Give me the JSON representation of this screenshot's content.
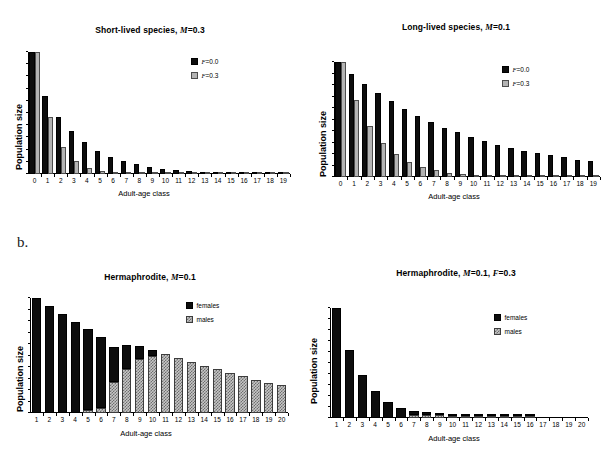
{
  "figure": {
    "panel_b_letter": "b."
  },
  "charts": [
    {
      "id": "short-lived",
      "title_main": "Short-lived species,",
      "title_param": "M",
      "title_value": "=0.3",
      "ylabel": "Population size",
      "xlabel": "Adult-age class",
      "legend": [
        {
          "label_ital": "F",
          "label_rest": "=0.0",
          "swatch": "black"
        },
        {
          "label_ital": "F",
          "label_rest": "=0.3",
          "swatch": "gray"
        }
      ],
      "chart_data": {
        "type": "bar",
        "title": "Short-lived species, M=0.3",
        "xlabel": "Adult-age class",
        "ylabel": "Population size",
        "grid": false,
        "legend_position": "upper-right-inside",
        "ylim": [
          0,
          100
        ],
        "categories": [
          "0",
          "1",
          "2",
          "3",
          "4",
          "5",
          "6",
          "7",
          "8",
          "9",
          "10",
          "11",
          "12",
          "13",
          "14",
          "15",
          "16",
          "17",
          "18",
          "19"
        ],
        "series": [
          {
            "name": "F=0.0",
            "color": "#0d0d0d",
            "values": [
              100,
              64,
              47,
              35,
              26,
              19,
              14,
              10.5,
              7.8,
              5.8,
              4.3,
              3.2,
              2.4,
              1.7,
              1.3,
              1.0,
              0.8,
              0.6,
              0.5,
              0.4
            ]
          },
          {
            "name": "F=0.3",
            "color": "#b4b4b4",
            "values": [
              100,
              47,
              22,
              10.5,
              5.0,
              2.3,
              1.1,
              0.5,
              0.3,
              0.2,
              0.15,
              0.1,
              0.1,
              0.1,
              0.1,
              0.1,
              0.1,
              0.1,
              0.1,
              0.1
            ]
          }
        ]
      }
    },
    {
      "id": "long-lived",
      "title_main": "Long-lived species,",
      "title_param": "M",
      "title_value": "=0.1",
      "ylabel": "Population size",
      "xlabel": "Adult-age class",
      "legend": [
        {
          "label_ital": "F",
          "label_rest": "=0.0",
          "swatch": "black"
        },
        {
          "label_ital": "F",
          "label_rest": "=0.3",
          "swatch": "gray"
        }
      ],
      "chart_data": {
        "type": "bar",
        "title": "Long-lived species, M=0.1",
        "xlabel": "Adult-age class",
        "ylabel": "Population size",
        "grid": false,
        "legend_position": "upper-right-inside",
        "ylim": [
          0,
          100
        ],
        "categories": [
          "0",
          "1",
          "2",
          "3",
          "4",
          "5",
          "6",
          "7",
          "8",
          "9",
          "10",
          "11",
          "12",
          "13",
          "14",
          "15",
          "16",
          "17",
          "18",
          "19"
        ],
        "series": [
          {
            "name": "F=0.0",
            "color": "#0d0d0d",
            "values": [
              100,
              90,
              81,
              73,
              66,
              59,
              53,
              48,
              43,
              39,
              35,
              31,
              28,
              25,
              23,
              21,
              19,
              17,
              15,
              14
            ]
          },
          {
            "name": "F=0.3",
            "color": "#b4b4b4",
            "values": [
              100,
              67,
              44,
              30,
              20,
              13,
              8.7,
              5.8,
              3.9,
              2.6,
              1.7,
              1.1,
              0.8,
              0.5,
              0.3,
              0.2,
              0.15,
              0.1,
              0.1,
              0.1
            ]
          }
        ]
      }
    },
    {
      "id": "hermaphrodite-f0",
      "title_main": "Hermaphrodite,",
      "title_param": "M",
      "title_value": "=0.1",
      "ylabel": "Population size",
      "xlabel": "Adult-age class",
      "legend": [
        {
          "label_ital": "",
          "label_rest": "females",
          "swatch": "black"
        },
        {
          "label_ital": "",
          "label_rest": "males",
          "swatch": "hatch"
        }
      ],
      "chart_data": {
        "type": "bar",
        "stacked": true,
        "title": "Hermaphrodite, M=0.1",
        "xlabel": "Adult-age class",
        "ylabel": "Population size",
        "grid": false,
        "legend_position": "upper-right-inside",
        "ylim": [
          0,
          100
        ],
        "categories": [
          "1",
          "2",
          "3",
          "4",
          "5",
          "6",
          "7",
          "8",
          "9",
          "10",
          "11",
          "12",
          "13",
          "14",
          "15",
          "16",
          "17",
          "18",
          "19",
          "20"
        ],
        "series": [
          {
            "name": "males",
            "color": "#c6c6c6",
            "values": [
              0,
              0,
              0,
              0,
              3,
              4,
              27,
              38,
              47,
              50,
              51,
              48,
              44,
              41,
              38,
              35,
              32,
              29,
              26,
              24
            ]
          },
          {
            "name": "females",
            "color": "#0d0d0d",
            "values": [
              100,
              93,
              86,
              79,
              70,
              62,
              30,
              21,
              11,
              5,
              0,
              0,
              0,
              0,
              0,
              0,
              0,
              0,
              0,
              0
            ]
          }
        ]
      }
    },
    {
      "id": "hermaphrodite-f03",
      "title_main": "Hermaphrodite,",
      "title_param": "M",
      "title_value": "=0.1,",
      "title_param2": "F",
      "title_value2": "=0.3",
      "ylabel": "Population size",
      "xlabel": "Adult-age class",
      "legend": [
        {
          "label_ital": "",
          "label_rest": "females",
          "swatch": "black"
        },
        {
          "label_ital": "",
          "label_rest": "males",
          "swatch": "hatch"
        }
      ],
      "chart_data": {
        "type": "bar",
        "stacked": true,
        "title": "Hermaphrodite, M=0.1, F=0.3",
        "xlabel": "Adult-age class",
        "ylabel": "Population size",
        "grid": false,
        "legend_position": "upper-right-inside",
        "ylim": [
          0,
          100
        ],
        "categories": [
          "1",
          "2",
          "3",
          "4",
          "5",
          "6",
          "7",
          "8",
          "9",
          "10",
          "11",
          "12",
          "13",
          "14",
          "15",
          "16",
          "17",
          "18",
          "19",
          "20"
        ],
        "series": [
          {
            "name": "males",
            "color": "#c6c6c6",
            "values": [
              0,
              0,
              0,
              0,
              0,
              0,
              2.5,
              2.5,
              2.5,
              2.0,
              1.5,
              1.2,
              1.0,
              0.8,
              0.7,
              0.6,
              0,
              0,
              0,
              0
            ]
          },
          {
            "name": "females",
            "color": "#0d0d0d",
            "values": [
              100,
              62,
              39,
              25,
              15,
              9.5,
              4.0,
              3.0,
              1.2,
              0.8,
              0.5,
              0.4,
              0.3,
              0.25,
              0.2,
              0.15,
              0,
              0,
              0,
              0
            ]
          }
        ]
      }
    }
  ]
}
